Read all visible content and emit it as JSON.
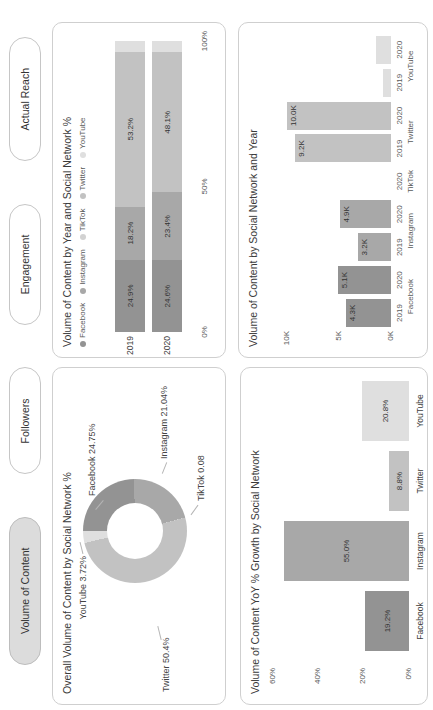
{
  "tabs": [
    {
      "label": "Volume of Content",
      "selected": true
    },
    {
      "label": "Followers",
      "selected": false
    },
    {
      "label": "Engagement",
      "selected": false
    },
    {
      "label": "Actual Reach",
      "selected": false
    }
  ],
  "colors": {
    "facebook": "#939393",
    "instagram": "#a8a8a8",
    "tiktok": "#d2d2d2",
    "twitter": "#c2c2c2",
    "youtube": "#dfdfdf"
  },
  "chart_data": [
    {
      "id": "overall_volume_donut",
      "type": "pie",
      "donut": true,
      "title": "Overall Volume of Content by Social Network %",
      "slices": [
        {
          "name": "Facebook",
          "value": 24.75,
          "label": "Facebook 24.75%"
        },
        {
          "name": "Instagram",
          "value": 21.04,
          "label": "Instagram 21.04%"
        },
        {
          "name": "TikTok",
          "value": 0.08,
          "label": "TikTok 0.08"
        },
        {
          "name": "Twitter",
          "value": 50.4,
          "label": "Twitter 50.4%"
        },
        {
          "name": "YouTube",
          "value": 3.72,
          "label": "YouTube 3.72%"
        }
      ]
    },
    {
      "id": "volume_by_year_stacked",
      "type": "bar",
      "orientation": "horizontal",
      "stacked": true,
      "title": "Volume of Content by Year and Social Network %",
      "legend": [
        "Facebook",
        "Instagram",
        "TikTok",
        "Twitter",
        "YouTube"
      ],
      "categories": [
        "2019",
        "2020"
      ],
      "series": [
        {
          "name": "Facebook",
          "values": [
            24.9,
            24.6
          ],
          "labels": [
            "24.9%",
            "24.6%"
          ]
        },
        {
          "name": "Instagram",
          "values": [
            18.2,
            23.4
          ],
          "labels": [
            "18.2%",
            "23.4%"
          ]
        },
        {
          "name": "TikTok",
          "values": [
            0.0,
            0.0
          ],
          "labels": [
            "",
            ""
          ]
        },
        {
          "name": "Twitter",
          "values": [
            53.2,
            48.1
          ],
          "labels": [
            "53.2%",
            "48.1%"
          ]
        },
        {
          "name": "YouTube",
          "values": [
            3.7,
            3.9
          ],
          "labels": [
            "",
            ""
          ]
        }
      ],
      "x_ticks": [
        "0%",
        "50%",
        "100%"
      ],
      "xlim": [
        0,
        100
      ]
    },
    {
      "id": "yoy_growth",
      "type": "bar",
      "title": "Volume of Content YoY % Growth by Social Network",
      "categories": [
        "Facebook",
        "Instagram",
        "Twitter",
        "YouTube"
      ],
      "values": [
        19.2,
        55.0,
        8.8,
        20.8
      ],
      "labels": [
        "19.2%",
        "55.0%",
        "8.8%",
        "20.8%"
      ],
      "y_ticks": [
        "0%",
        "20%",
        "40%",
        "60%"
      ],
      "ylim": [
        0,
        60
      ]
    },
    {
      "id": "volume_by_network_year",
      "type": "bar",
      "title": "Volume of Content by Social Network and Year",
      "groups": [
        {
          "network": "Facebook",
          "bars": [
            {
              "year": "2019",
              "value": 4.3,
              "label": "4.3K"
            },
            {
              "year": "2020",
              "value": 5.1,
              "label": "5.1K"
            }
          ]
        },
        {
          "network": "Instagram",
          "bars": [
            {
              "year": "2019",
              "value": 3.2,
              "label": "3.2K"
            },
            {
              "year": "2020",
              "value": 4.9,
              "label": "4.9K"
            }
          ]
        },
        {
          "network": "TikTok",
          "bars": [
            {
              "year": "2020",
              "value": 0,
              "label": ""
            }
          ]
        },
        {
          "network": "Twitter",
          "bars": [
            {
              "year": "2019",
              "value": 9.2,
              "label": "9.2K"
            },
            {
              "year": "2020",
              "value": 10.0,
              "label": "10.0K"
            }
          ]
        },
        {
          "network": "YouTube",
          "bars": [
            {
              "year": "2019",
              "value": 0.8,
              "label": ""
            },
            {
              "year": "2020",
              "value": 1.4,
              "label": ""
            }
          ]
        }
      ],
      "y_ticks": [
        "0K",
        "5K",
        "10K"
      ],
      "ylim": [
        0,
        10
      ]
    }
  ]
}
